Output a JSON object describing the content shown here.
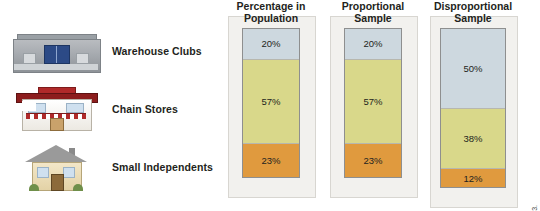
{
  "figure": {
    "credit": "© Cengage Learning 2013."
  },
  "rows": [
    {
      "label": "Warehouse Clubs",
      "icon": "warehouse-club-building-icon"
    },
    {
      "label": "Chain Stores",
      "icon": "chain-store-building-icon"
    },
    {
      "label": "Small Independents",
      "icon": "small-independent-house-icon"
    }
  ],
  "colors": {
    "warehouse": "#cdd8df",
    "chain": "#d9d88a",
    "small": "#e09a3e",
    "bar_border": "#8e8f8f",
    "panel": "#f2f1ee"
  },
  "columns": [
    {
      "title": "Percentage in\nPopulation",
      "segments": [
        {
          "category": "Warehouse Clubs",
          "value": "20%",
          "pct": 20
        },
        {
          "category": "Chain Stores",
          "value": "57%",
          "pct": 57
        },
        {
          "category": "Small Independents",
          "value": "23%",
          "pct": 23
        }
      ]
    },
    {
      "title": "Proportional\nSample",
      "segments": [
        {
          "category": "Warehouse Clubs",
          "value": "20%",
          "pct": 20
        },
        {
          "category": "Chain Stores",
          "value": "57%",
          "pct": 57
        },
        {
          "category": "Small Independents",
          "value": "23%",
          "pct": 23
        }
      ]
    },
    {
      "title": "Disproportional\nSample",
      "segments": [
        {
          "category": "Warehouse Clubs",
          "value": "50%",
          "pct": 50
        },
        {
          "category": "Chain Stores",
          "value": "38%",
          "pct": 38
        },
        {
          "category": "Small Independents",
          "value": "12%",
          "pct": 12
        }
      ]
    }
  ]
}
